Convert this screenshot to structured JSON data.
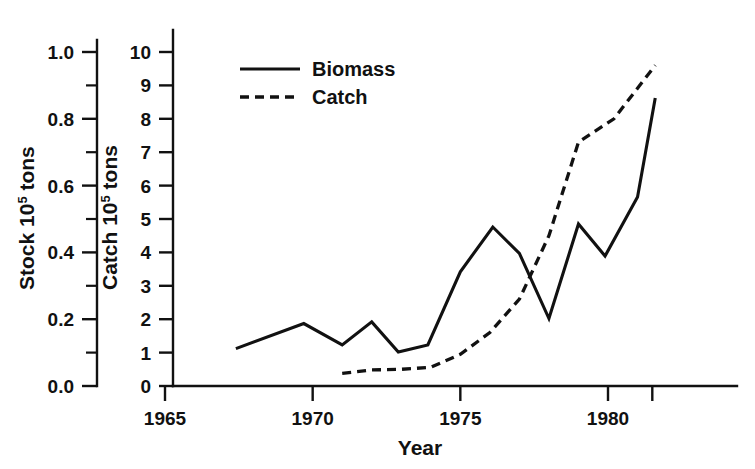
{
  "chart_data": {
    "type": "line",
    "title": "",
    "xlabel": "Year",
    "ylabel_left": "Stock 10^5 tons",
    "ylabel_right_inner": "Catch 10^5 tons",
    "axis_left": {
      "label_prefix": "Stock 10",
      "label_exponent": "5",
      "label_suffix": " tons",
      "ticks": [
        "0.0",
        "0.2",
        "0.4",
        "0.6",
        "0.8",
        "1.0"
      ],
      "tick_values": [
        0.0,
        0.2,
        0.4,
        0.6,
        0.8,
        1.0
      ],
      "minor_ticks": [
        0.1,
        0.3,
        0.5,
        0.7,
        0.9
      ],
      "range": [
        0.0,
        1.0
      ]
    },
    "axis_catch": {
      "label_prefix": "Catch 10",
      "label_exponent": "5",
      "label_suffix": " tons",
      "ticks": [
        "0",
        "1",
        "2",
        "3",
        "4",
        "5",
        "6",
        "7",
        "8",
        "9",
        "10"
      ],
      "tick_values": [
        0,
        1,
        2,
        3,
        4,
        5,
        6,
        7,
        8,
        9,
        10
      ],
      "range": [
        0,
        10
      ]
    },
    "axis_x": {
      "ticks": [
        "1965",
        "1970",
        "1975",
        "1980"
      ],
      "tick_values": [
        1965,
        1970,
        1975,
        1980
      ],
      "extra_tick_values": [
        1981.5
      ],
      "range": [
        1965,
        1981.7
      ]
    },
    "grid": false,
    "legend": {
      "position": "top-center-left",
      "entries": [
        {
          "name": "Biomass",
          "style": "solid",
          "axis": "stock"
        },
        {
          "name": "Catch",
          "style": "dashed",
          "axis": "catch"
        }
      ]
    },
    "series": [
      {
        "name": "Biomass",
        "style": "solid",
        "axis": "stock",
        "x": [
          1967.4,
          1969.7,
          1971.0,
          1972.0,
          1972.9,
          1973.9,
          1975.0,
          1976.1,
          1977.0,
          1978.0,
          1979.0,
          1979.9,
          1981.0,
          1981.6
        ],
        "values": [
          0.112,
          0.187,
          0.123,
          0.192,
          0.102,
          0.123,
          0.342,
          0.476,
          0.397,
          0.202,
          0.485,
          0.389,
          0.566,
          0.862
        ]
      },
      {
        "name": "Catch",
        "style": "dashed",
        "axis": "catch",
        "x": [
          1971.0,
          1972.0,
          1973.0,
          1974.0,
          1975.0,
          1976.0,
          1977.0,
          1978.0,
          1979.0,
          1980.2,
          1981.6
        ],
        "values": [
          0.38,
          0.48,
          0.5,
          0.56,
          0.95,
          1.6,
          2.6,
          4.5,
          7.3,
          8.0,
          9.6
        ]
      }
    ]
  }
}
